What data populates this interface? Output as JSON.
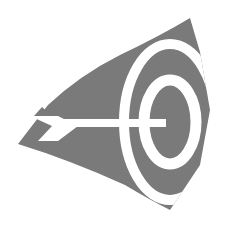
{
  "logo": {
    "name": "target-with-arrow",
    "alt": "Target with arrow logo",
    "colors": {
      "fill": "#7a7a7a",
      "background": "#ffffff"
    }
  }
}
